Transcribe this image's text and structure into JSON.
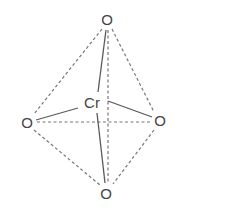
{
  "diagram": {
    "title": "",
    "type": "tetrahedral molecular structure",
    "atoms": {
      "center": {
        "label": "Cr",
        "x": 92,
        "y": 103
      },
      "top": {
        "label": "O",
        "x": 107,
        "y": 19
      },
      "left": {
        "label": "O",
        "x": 27,
        "y": 122
      },
      "right": {
        "label": "O",
        "x": 160,
        "y": 120
      },
      "bottom": {
        "label": "O",
        "x": 106,
        "y": 193
      }
    },
    "colors": {
      "text": "#444444",
      "bond": "#5a5a5a",
      "edge": "#777777"
    }
  }
}
